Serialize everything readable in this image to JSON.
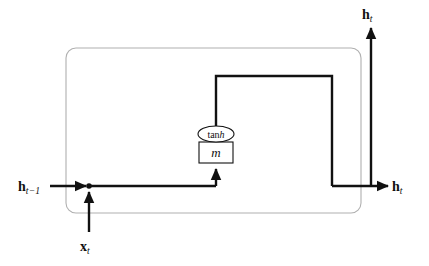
{
  "diagram": {
    "cell_boundary": {
      "name": "rnn-cell-boundary",
      "shape": "rounded-rectangle",
      "stroke": "#b0b0b0",
      "x": 66,
      "y": 48,
      "width": 295,
      "height": 165,
      "rx": 10
    },
    "colors": {
      "signal": "#111111",
      "boundary": "#b0b0b0",
      "node_stroke": "#111111",
      "background": "#ffffff"
    },
    "nodes": [
      {
        "name": "tanh-activation-node",
        "shape": "ellipse",
        "label_plain": "tanh",
        "label_prefix": "tan",
        "label_italic": "h",
        "cx": 216,
        "cy": 134,
        "rx": 18,
        "ry": 8
      },
      {
        "name": "m-unit-box",
        "shape": "rectangle",
        "label_plain": "m",
        "x": 199,
        "y": 142,
        "width": 34,
        "height": 21
      }
    ],
    "junction": {
      "name": "signal-junction-dot",
      "cx": 89,
      "cy": 186,
      "r": 2.6
    },
    "labels": [
      {
        "name": "label-h-prev",
        "symbol": "h",
        "subscript": "t−1",
        "text": "h_{t−1}",
        "role": "previous-hidden-state-input",
        "x": 18,
        "y": 178
      },
      {
        "name": "label-x-t",
        "symbol": "x",
        "subscript": "t",
        "text": "x_t",
        "role": "input-vector",
        "x": 80,
        "y": 238
      },
      {
        "name": "label-h-top",
        "symbol": "h",
        "subscript": "t",
        "text": "h_t",
        "role": "hidden-state-output-up",
        "x": 362,
        "y": 6
      },
      {
        "name": "label-h-right",
        "symbol": "h",
        "subscript": "t",
        "text": "h_t",
        "role": "hidden-state-output-right",
        "x": 392,
        "y": 178
      }
    ],
    "edges": [
      {
        "name": "edge-h-prev-into-cell",
        "from": "h_{t-1}",
        "to": "junction",
        "arrow": true
      },
      {
        "name": "edge-x-t-into-junction",
        "from": "x_t",
        "to": "junction",
        "arrow": true
      },
      {
        "name": "edge-junction-to-m",
        "from": "junction",
        "to": "m",
        "arrow": true
      },
      {
        "name": "edge-m-to-tanh",
        "from": "m",
        "to": "tanh",
        "arrow": false
      },
      {
        "name": "edge-tanh-up-and-over",
        "from": "tanh",
        "to": "output-bus",
        "arrow": false
      },
      {
        "name": "edge-output-to-h-right",
        "from": "output-bus",
        "to": "h_t-right",
        "arrow": true
      },
      {
        "name": "edge-output-to-h-top",
        "from": "output-bus",
        "to": "h_t-top",
        "arrow": true
      }
    ]
  }
}
